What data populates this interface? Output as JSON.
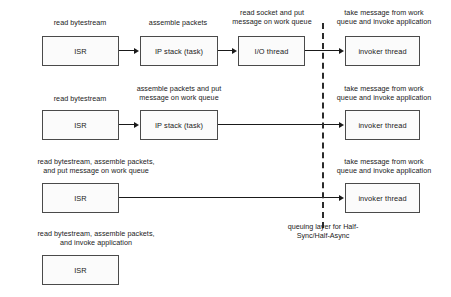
{
  "diagram": {
    "divider": {
      "label": "queuing layer for Half-\nSync/Half-Async",
      "style": "dashed-vertical",
      "color": "#2b2b2b"
    },
    "rows": [
      {
        "id": "row-1",
        "captions": [
          {
            "id": "caption-r1-isr",
            "text": "read bytestream"
          },
          {
            "id": "caption-r1-ipstack",
            "text": "assemble packets"
          },
          {
            "id": "caption-r1-iothread",
            "text": "read socket and put\nmessage on work queue"
          },
          {
            "id": "caption-r1-invoker",
            "text": "take message from work\nqueue and invoke application"
          }
        ],
        "boxes": [
          {
            "id": "box-r1-isr",
            "label": "ISR"
          },
          {
            "id": "box-r1-ipstack",
            "label": "IP stack (task)"
          },
          {
            "id": "box-r1-iothread",
            "label": "I/O thread"
          },
          {
            "id": "box-r1-invoker",
            "label": "invoker thread"
          }
        ]
      },
      {
        "id": "row-2",
        "captions": [
          {
            "id": "caption-r2-isr",
            "text": "read bytestream"
          },
          {
            "id": "caption-r2-ipstack",
            "text": "assemble packets and put\nmessage on work queue"
          },
          {
            "id": "caption-r2-invoker",
            "text": "take message from work\nqueue and invoke application"
          }
        ],
        "boxes": [
          {
            "id": "box-r2-isr",
            "label": "ISR"
          },
          {
            "id": "box-r2-ipstack",
            "label": "IP stack (task)"
          },
          {
            "id": "box-r2-invoker",
            "label": "invoker thread"
          }
        ]
      },
      {
        "id": "row-3",
        "captions": [
          {
            "id": "caption-r3-isr",
            "text": "read bytestream, assemble packets,\nand put message on work queue"
          },
          {
            "id": "caption-r3-invoker",
            "text": "take message from work\nqueue and invoke application"
          }
        ],
        "boxes": [
          {
            "id": "box-r3-isr",
            "label": "ISR"
          },
          {
            "id": "box-r3-invoker",
            "label": "invoker thread"
          }
        ]
      },
      {
        "id": "row-4",
        "captions": [
          {
            "id": "caption-r4-isr",
            "text": "read bytestream, assemble packets,\nand invoke application"
          }
        ],
        "boxes": [
          {
            "id": "box-r4-isr",
            "label": "ISR"
          }
        ]
      }
    ]
  }
}
